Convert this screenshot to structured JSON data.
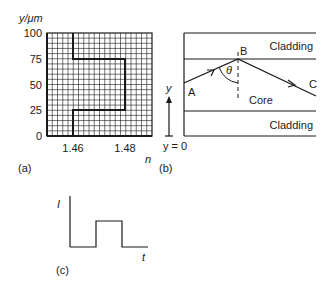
{
  "panels": {
    "a": {
      "label": "(a)",
      "y_axis_label": "y/μm",
      "x_axis_label": "n",
      "y_ticks": [
        "100",
        "75",
        "50",
        "25",
        "0"
      ],
      "x_ticks": [
        "1.46",
        "1.48"
      ]
    },
    "b": {
      "label": "(b)",
      "cladding_top": "Cladding",
      "cladding_bottom": "Cladding",
      "core": "Core",
      "point_a": "A",
      "point_b": "B",
      "point_c": "C",
      "angle": "θ",
      "y_axis": "y",
      "y_origin": "y = 0"
    },
    "c": {
      "label": "(c)",
      "y_axis_label": "I",
      "x_axis_label": "t"
    }
  },
  "chart_data": [
    {
      "type": "line",
      "title": "Refractive index profile",
      "xlabel": "n",
      "ylabel": "y/μm",
      "x": [
        1.46,
        1.46,
        1.48,
        1.48,
        1.46,
        1.46
      ],
      "y": [
        0,
        25,
        25,
        75,
        75,
        100
      ],
      "xlim": [
        1.45,
        1.487
      ],
      "ylim": [
        0,
        100
      ],
      "x_tick_labels": [
        "1.46",
        "1.48"
      ],
      "y_tick_labels": [
        "0",
        "25",
        "50",
        "75",
        "100"
      ],
      "grid": true
    },
    {
      "type": "line",
      "title": "Input pulse",
      "xlabel": "t",
      "ylabel": "I",
      "x": [
        0,
        1,
        1,
        2,
        2,
        3
      ],
      "y": [
        0,
        0,
        1,
        1,
        0,
        0
      ],
      "grid": false
    }
  ]
}
